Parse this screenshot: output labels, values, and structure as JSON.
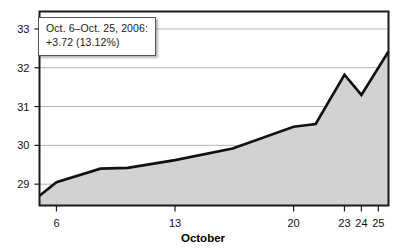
{
  "chart_data": {
    "type": "area",
    "title": "",
    "xlabel": "October",
    "ylabel": "",
    "ylim": [
      28.45,
      33.45
    ],
    "xlim": [
      5.0,
      25.6
    ],
    "grid": true,
    "legend": false,
    "annotation": {
      "line1": "Oct. 6–Oct. 25, 2006:",
      "line2": "+3.72 (13.12%)"
    },
    "y_ticks": [
      29,
      30,
      31,
      32,
      33
    ],
    "y_tick_labels": [
      "29",
      "30",
      "31",
      "32",
      "33"
    ],
    "x_ticks": [
      6,
      13,
      20,
      23,
      24,
      25
    ],
    "x_tick_labels": [
      "6",
      "13",
      "20",
      "23",
      "24",
      "25"
    ],
    "series_name": "Price",
    "x": [
      5.0,
      6.0,
      8.6,
      10.2,
      13.0,
      16.4,
      20.0,
      21.3,
      23.0,
      24.0,
      25.6
    ],
    "values": [
      28.7,
      29.05,
      29.4,
      29.42,
      29.62,
      29.92,
      30.48,
      30.55,
      31.82,
      31.3,
      32.42
    ],
    "colors": {
      "line": "#111111",
      "fill": "#d2d2d2",
      "grid": "#b4b4b4",
      "axis": "#1a1a1a",
      "background": "#ffffff"
    }
  },
  "axes": {
    "x_title": "October"
  }
}
